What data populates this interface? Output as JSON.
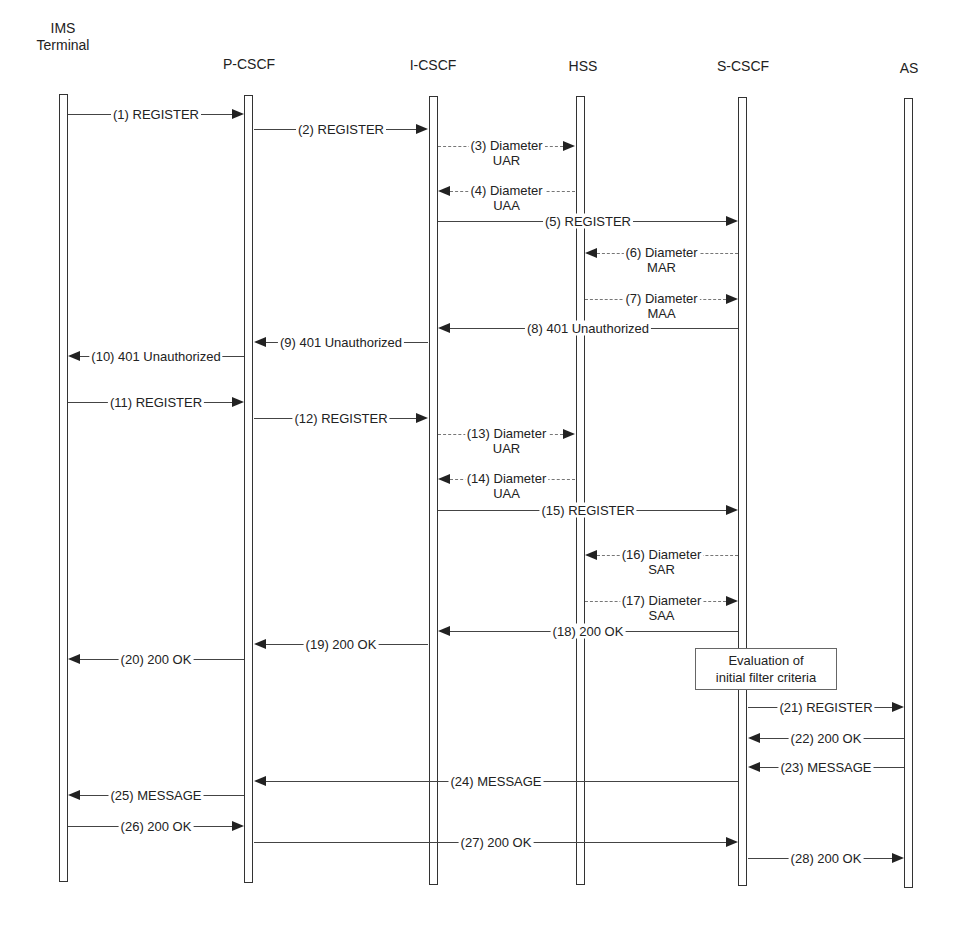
{
  "entities": [
    {
      "id": "ims",
      "label": "IMS\nTerminal",
      "line1": "IMS",
      "line2": "Terminal",
      "x": 63
    },
    {
      "id": "pcscf",
      "label": "P-CSCF",
      "x": 249
    },
    {
      "id": "icscf",
      "label": "I-CSCF",
      "x": 433
    },
    {
      "id": "hss",
      "label": "HSS",
      "x": 580
    },
    {
      "id": "scscf",
      "label": "S-CSCF",
      "x": 743
    },
    {
      "id": "as",
      "label": "AS",
      "x": 909
    }
  ],
  "messages": [
    {
      "n": 1,
      "label": "(1) REGISTER",
      "from": "ims",
      "to": "pcscf",
      "y": 114
    },
    {
      "n": 2,
      "label": "(2) REGISTER",
      "from": "pcscf",
      "to": "icscf",
      "y": 129
    },
    {
      "n": 3,
      "label": "(3) Diameter\nUAR",
      "from": "icscf",
      "to": "hss",
      "y": 146,
      "dashed": true
    },
    {
      "n": 4,
      "label": "(4) Diameter\nUAA",
      "from": "hss",
      "to": "icscf",
      "y": 191,
      "dashed": true
    },
    {
      "n": 5,
      "label": "(5) REGISTER",
      "from": "icscf",
      "to": "scscf",
      "y": 221
    },
    {
      "n": 6,
      "label": "(6) Diameter\nMAR",
      "from": "scscf",
      "to": "hss",
      "y": 253,
      "dashed": true
    },
    {
      "n": 7,
      "label": "(7) Diameter\nMAA",
      "from": "hss",
      "to": "scscf",
      "y": 299,
      "dashed": true
    },
    {
      "n": 8,
      "label": "(8) 401 Unauthorized",
      "from": "scscf",
      "to": "icscf",
      "y": 328
    },
    {
      "n": 9,
      "label": "(9) 401 Unauthorized",
      "from": "icscf",
      "to": "pcscf",
      "y": 342
    },
    {
      "n": 10,
      "label": "(10) 401 Unauthorized",
      "from": "pcscf",
      "to": "ims",
      "y": 356
    },
    {
      "n": 11,
      "label": "(11) REGISTER",
      "from": "ims",
      "to": "pcscf",
      "y": 402
    },
    {
      "n": 12,
      "label": "(12) REGISTER",
      "from": "pcscf",
      "to": "icscf",
      "y": 418
    },
    {
      "n": 13,
      "label": "(13) Diameter\nUAR",
      "from": "icscf",
      "to": "hss",
      "y": 434,
      "dashed": true
    },
    {
      "n": 14,
      "label": "(14) Diameter\nUAA",
      "from": "hss",
      "to": "icscf",
      "y": 479,
      "dashed": true
    },
    {
      "n": 15,
      "label": "(15) REGISTER",
      "from": "icscf",
      "to": "scscf",
      "y": 510
    },
    {
      "n": 16,
      "label": "(16) Diameter\nSAR",
      "from": "scscf",
      "to": "hss",
      "y": 555,
      "dashed": true
    },
    {
      "n": 17,
      "label": "(17) Diameter\nSAA",
      "from": "hss",
      "to": "scscf",
      "y": 601,
      "dashed": true
    },
    {
      "n": 18,
      "label": "(18) 200 OK",
      "from": "scscf",
      "to": "icscf",
      "y": 631
    },
    {
      "n": 19,
      "label": "(19) 200 OK",
      "from": "icscf",
      "to": "pcscf",
      "y": 644
    },
    {
      "n": 20,
      "label": "(20) 200 OK",
      "from": "pcscf",
      "to": "ims",
      "y": 659
    },
    {
      "n": 21,
      "label": "(21) REGISTER",
      "from": "scscf",
      "to": "as",
      "y": 707
    },
    {
      "n": 22,
      "label": "(22) 200 OK",
      "from": "as",
      "to": "scscf",
      "y": 738
    },
    {
      "n": 23,
      "label": "(23) MESSAGE",
      "from": "as",
      "to": "scscf",
      "y": 767
    },
    {
      "n": 24,
      "label": "(24) MESSAGE",
      "from": "scscf",
      "to": "pcscf",
      "y": 781
    },
    {
      "n": 25,
      "label": "(25) MESSAGE",
      "from": "pcscf",
      "to": "ims",
      "y": 795
    },
    {
      "n": 26,
      "label": "(26) 200 OK",
      "from": "ims",
      "to": "pcscf",
      "y": 826
    },
    {
      "n": 27,
      "label": "(27) 200 OK",
      "from": "pcscf",
      "to": "scscf",
      "y": 842
    },
    {
      "n": 28,
      "label": "(28) 200 OK",
      "from": "scscf",
      "to": "as",
      "y": 858
    }
  ],
  "note": {
    "line1": "Evaluation of",
    "line2": "initial filter criteria",
    "on": "scscf"
  }
}
